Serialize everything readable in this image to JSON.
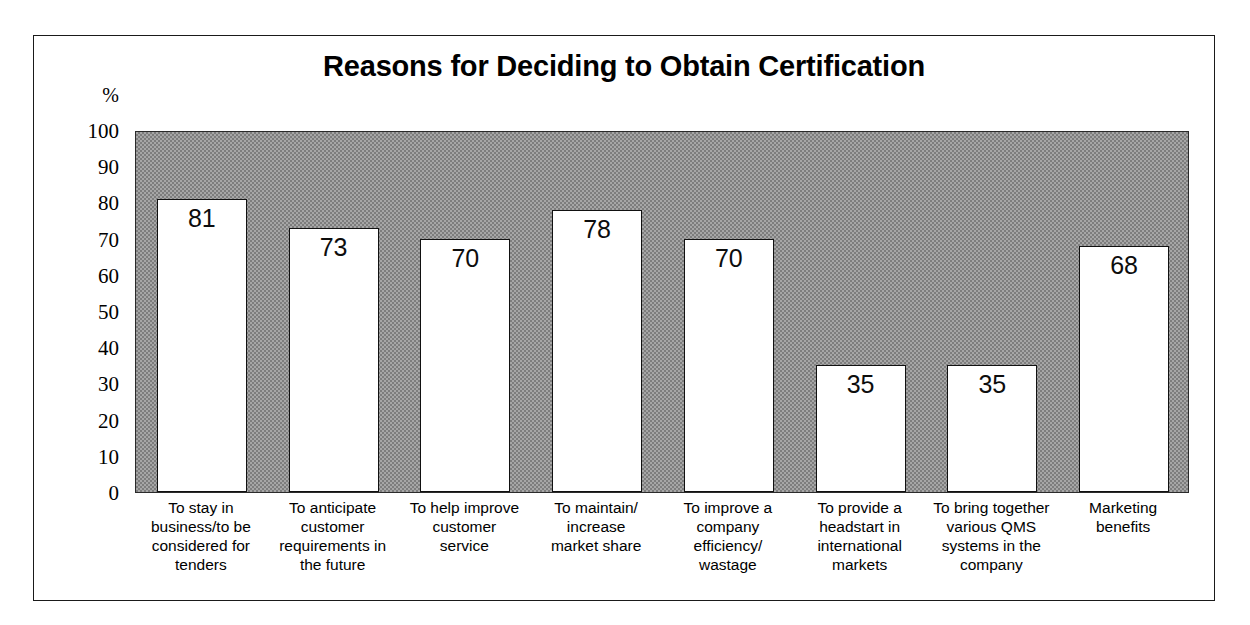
{
  "chart_data": {
    "type": "bar",
    "title": "Reasons for Deciding to Obtain Certification",
    "xlabel": "",
    "ylabel": "%",
    "ylim": [
      0,
      100
    ],
    "yticks": [
      "100",
      "90",
      "80",
      "70",
      "60",
      "50",
      "40",
      "30",
      "20",
      "10",
      "0"
    ],
    "ytick_values": [
      100,
      90,
      80,
      70,
      60,
      50,
      40,
      30,
      20,
      10,
      0
    ],
    "grid": false,
    "legend": "none",
    "bar_color": "#ffffff",
    "bar_edge_color": "#111111",
    "plot_background": "#a6a6a6",
    "categories": [
      "To stay in business/to be considered for tenders",
      "To anticipate customer requirements in the future",
      "To help improve customer service",
      "To maintain/increase market share",
      "To improve a company efficiency/wastage",
      "To provide a headstart in international markets",
      "To bring together various QMS systems in the company",
      "Marketing benefits"
    ],
    "category_lines": [
      [
        "To stay in",
        "business/to be",
        "considered for",
        "tenders"
      ],
      [
        "To anticipate",
        "customer",
        "requirements in",
        "the future"
      ],
      [
        "To help improve",
        "customer",
        "service"
      ],
      [
        "To maintain/",
        "increase",
        "market share"
      ],
      [
        "To improve a",
        "company",
        "efficiency/",
        "wastage"
      ],
      [
        "To provide a",
        "headstart in",
        "international",
        "markets"
      ],
      [
        "To bring together",
        "various QMS",
        "systems in the",
        "company"
      ],
      [
        "Marketing",
        "benefits"
      ]
    ],
    "values": [
      81,
      73,
      70,
      78,
      70,
      35,
      35,
      68
    ],
    "value_labels": [
      "81",
      "73",
      "70",
      "78",
      "70",
      "35",
      "35",
      "68"
    ]
  }
}
